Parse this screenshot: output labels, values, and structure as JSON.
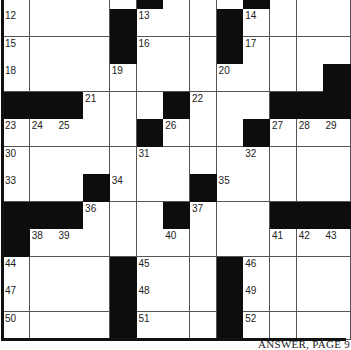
{
  "puzzle": {
    "rows": 13,
    "cols": 13,
    "cell_width": 26.7,
    "cell_height": 27.5,
    "colors": {
      "block": "#0d0d0d",
      "cell": "#ffffff",
      "line": "#555555"
    },
    "grid": [
      ".....#...#...",
      "12,.,.,.,#,13,.,.,#,14,.,.,.",
      "15,.,.,.,#,16,.,.,#,17,.,.,.",
      "18,.,.,.,19,.,.,.,20,.,.,.,#",
      "#,#,#,21,.,.,#,22,.,.,#,#,#",
      "23,24,25,.,.,#,26,.,.,#,27,28,29",
      "30,.,.,.,.,31,.,.,.,32,.,.,.",
      "33,.,.,#,34,.,.,#,35,.,.,.,.",
      "#,#,#,36,.,.,#,37,.,.,#,#,#",
      "#,38,39,.,.,.,40,.,.,.,41,42,43",
      "44,.,.,.,#,45,.,.,#,46,.,.,.",
      "47,.,.,.,#,48,.,.,#,49,.,.,.",
      "50,.,.,.,#,51,.,.,#,52,.,.,."
    ]
  },
  "footer": {
    "text": "ANSWER, PAGE 9"
  }
}
